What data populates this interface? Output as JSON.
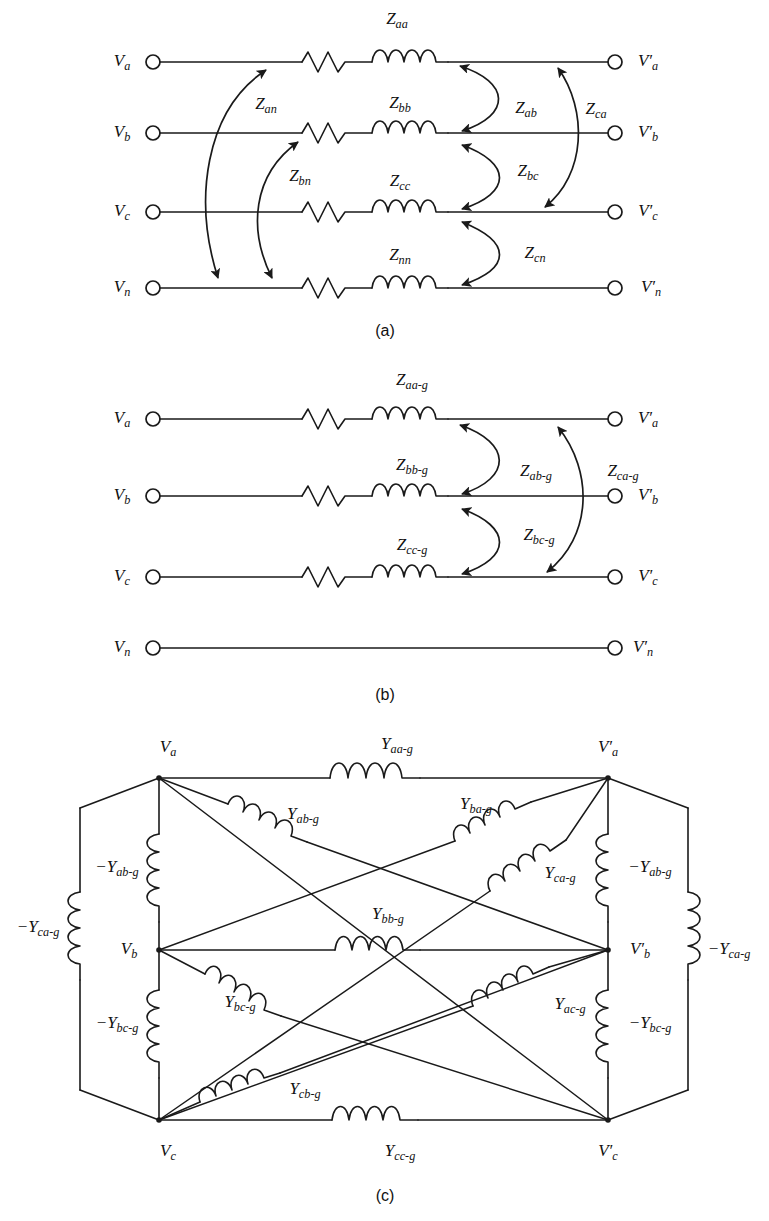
{
  "figure": {
    "panels": [
      {
        "id": "a",
        "caption": "(a)"
      },
      {
        "id": "b",
        "caption": "(b)"
      },
      {
        "id": "c",
        "caption": "(c)"
      }
    ],
    "line_color": "#1a1a1a",
    "background": "#ffffff"
  },
  "panel_a": {
    "caption": "(a)",
    "left_terminals": [
      {
        "key": "Va",
        "base": "V",
        "sub": "a"
      },
      {
        "key": "Vb",
        "base": "V",
        "sub": "b"
      },
      {
        "key": "Vc",
        "base": "V",
        "sub": "c"
      },
      {
        "key": "Vn",
        "base": "V",
        "sub": "n"
      }
    ],
    "right_terminals": [
      {
        "key": "Vpa",
        "base": "V′",
        "sub": "a"
      },
      {
        "key": "Vpb",
        "base": "V′",
        "sub": "b"
      },
      {
        "key": "Vpc",
        "base": "V′",
        "sub": "c"
      },
      {
        "key": "Vpn",
        "base": "V′",
        "sub": "n"
      }
    ],
    "self_impedances": [
      {
        "key": "Zaa",
        "base": "Z",
        "sub": "aa"
      },
      {
        "key": "Zbb",
        "base": "Z",
        "sub": "bb"
      },
      {
        "key": "Zcc",
        "base": "Z",
        "sub": "cc"
      },
      {
        "key": "Znn",
        "base": "Z",
        "sub": "nn"
      }
    ],
    "mutual_impedances": [
      {
        "key": "Zan",
        "base": "Z",
        "sub": "an"
      },
      {
        "key": "Zbn",
        "base": "Z",
        "sub": "bn"
      },
      {
        "key": "Zab",
        "base": "Z",
        "sub": "ab"
      },
      {
        "key": "Zca",
        "base": "Z",
        "sub": "ca"
      },
      {
        "key": "Zbc",
        "base": "Z",
        "sub": "bc"
      },
      {
        "key": "Zcn",
        "base": "Z",
        "sub": "cn"
      }
    ]
  },
  "panel_b": {
    "caption": "(b)",
    "left_terminals": [
      {
        "key": "Va",
        "base": "V",
        "sub": "a"
      },
      {
        "key": "Vb",
        "base": "V",
        "sub": "b"
      },
      {
        "key": "Vc",
        "base": "V",
        "sub": "c"
      },
      {
        "key": "Vn",
        "base": "V",
        "sub": "n"
      }
    ],
    "right_terminals": [
      {
        "key": "Vpa",
        "base": "V′",
        "sub": "a"
      },
      {
        "key": "Vpb",
        "base": "V′",
        "sub": "b"
      },
      {
        "key": "Vpc",
        "base": "V′",
        "sub": "c"
      },
      {
        "key": "Vpn",
        "base": "V′",
        "sub": "n"
      }
    ],
    "self_impedances": [
      {
        "key": "Zaag",
        "base": "Z",
        "sub": "aa-g"
      },
      {
        "key": "Zbbg",
        "base": "Z",
        "sub": "bb-g"
      },
      {
        "key": "Zccg",
        "base": "Z",
        "sub": "cc-g"
      }
    ],
    "mutual_impedances": [
      {
        "key": "Zabg",
        "base": "Z",
        "sub": "ab-g"
      },
      {
        "key": "Zcag",
        "base": "Z",
        "sub": "ca-g"
      },
      {
        "key": "Zbcg",
        "base": "Z",
        "sub": "bc-g"
      }
    ]
  },
  "panel_c": {
    "caption": "(c)",
    "nodes": [
      {
        "key": "Va",
        "base": "V",
        "sub": "a",
        "side": "left"
      },
      {
        "key": "Vb",
        "base": "V",
        "sub": "b",
        "side": "left"
      },
      {
        "key": "Vc",
        "base": "V",
        "sub": "c",
        "side": "left"
      },
      {
        "key": "Vpa",
        "base": "V′",
        "sub": "a",
        "side": "right"
      },
      {
        "key": "Vpb",
        "base": "V′",
        "sub": "b",
        "side": "right"
      },
      {
        "key": "Vpc",
        "base": "V′",
        "sub": "c",
        "side": "right"
      }
    ],
    "series_admittances": [
      {
        "key": "Yaag",
        "base": "Y",
        "sub": "aa-g"
      },
      {
        "key": "Ybbg",
        "base": "Y",
        "sub": "bb-g"
      },
      {
        "key": "Yccg",
        "base": "Y",
        "sub": "cc-g"
      }
    ],
    "cross_admittances": [
      {
        "key": "Yabg",
        "base": "Y",
        "sub": "ab-g"
      },
      {
        "key": "Ybag",
        "base": "Y",
        "sub": "ba-g"
      },
      {
        "key": "Ycag",
        "base": "Y",
        "sub": "ca-g"
      },
      {
        "key": "Ybcg",
        "base": "Y",
        "sub": "bc-g"
      },
      {
        "key": "Yacg",
        "base": "Y",
        "sub": "ac-g"
      },
      {
        "key": "Ycbg",
        "base": "Y",
        "sub": "cb-g"
      }
    ],
    "shunt_admittances": [
      {
        "key": "nYabg_left",
        "base": "−Y",
        "sub": "ab-g"
      },
      {
        "key": "nYcag_left",
        "base": "−Y",
        "sub": "ca-g"
      },
      {
        "key": "nYbcg_left",
        "base": "−Y",
        "sub": "bc-g"
      },
      {
        "key": "nYabg_right",
        "base": "−Y",
        "sub": "ab-g"
      },
      {
        "key": "nYcag_right",
        "base": "−Y",
        "sub": "ca-g"
      },
      {
        "key": "nYbcg_right",
        "base": "−Y",
        "sub": "bc-g"
      }
    ]
  }
}
